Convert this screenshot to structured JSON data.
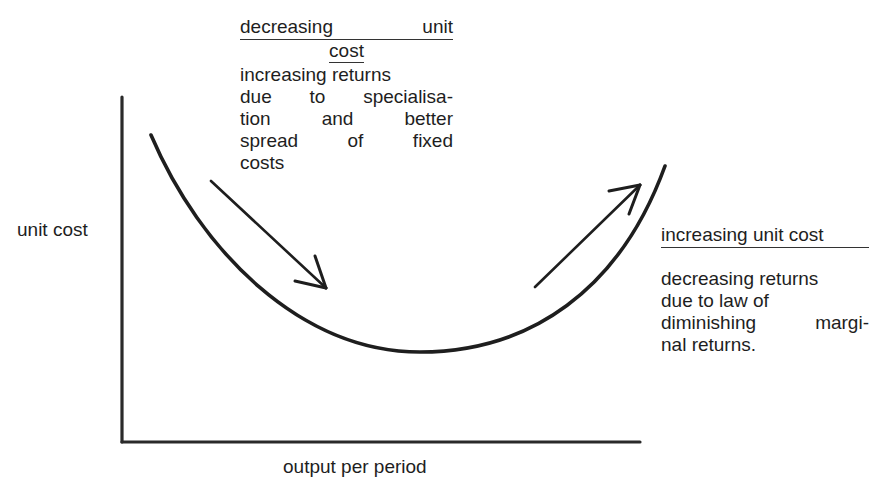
{
  "diagram": {
    "title": "",
    "axes": {
      "y_label": "unit cost",
      "x_label": "output per period"
    },
    "curve": {
      "type": "U-shaped average cost curve",
      "color": "#1e1e1e"
    },
    "annotation_left": {
      "heading_line1": "decreasing unit",
      "heading_line2": "cost",
      "body_lines": [
        "increasing returns",
        "due to specialisa-",
        "tion and better",
        "spread of fixed",
        "costs"
      ]
    },
    "annotation_right": {
      "heading": "increasing unit cost",
      "body_lines": [
        "decreasing returns",
        "due to law of",
        "diminishing margi-",
        "nal returns."
      ]
    },
    "arrows": [
      {
        "name": "downward-arrow",
        "direction": "down-right"
      },
      {
        "name": "upward-arrow",
        "direction": "up-right"
      }
    ]
  }
}
